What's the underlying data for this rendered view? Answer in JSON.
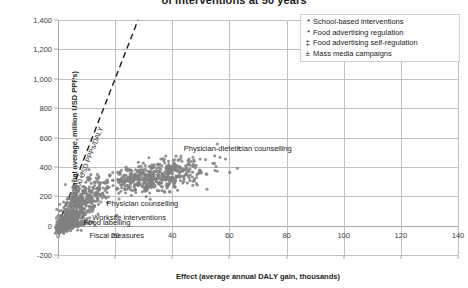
{
  "chart_data": {
    "type": "scatter",
    "title": "of interventions at 50 years",
    "xlabel": "Effect (average annual DALY gain, thousands)",
    "ylabel": "Cost (annual average, million USD PPPs)",
    "xlim": [
      0,
      140
    ],
    "ylim": [
      -200,
      1400
    ],
    "xticks": [
      "0",
      "20",
      "40",
      "60",
      "80",
      "100",
      "120",
      "140"
    ],
    "xtick_values": [
      0,
      20,
      40,
      60,
      80,
      100,
      120,
      140
    ],
    "yticks": [
      "-200",
      "0",
      "200",
      "400",
      "600",
      "800",
      "1,000",
      "1,200",
      "1,400"
    ],
    "ytick_values": [
      -200,
      0,
      200,
      400,
      600,
      800,
      1000,
      1200,
      1400
    ],
    "grid": true,
    "legend_position": "top-right",
    "marker_color": "#808080",
    "threshold": {
      "label": "50 000 USD PPPs/DALY",
      "slope_note": "line from origin, dashed",
      "x_at_ymax": 28,
      "style": "dashed"
    },
    "clusters": [
      {
        "name": "Physician-dietetician counselling",
        "label_x": 44,
        "label_y": 520,
        "center_x": 34,
        "center_y": 330,
        "spread_x": 9,
        "spread_y": 60,
        "n": 520
      },
      {
        "name": "Physician counselling",
        "label_x": 17,
        "label_y": 150,
        "center_x": 8,
        "center_y": 150,
        "spread_x": 4,
        "spread_y": 85,
        "n": 360
      },
      {
        "name": "Worksite interventions",
        "label_x": 12,
        "label_y": 55,
        "center_x": 3.5,
        "center_y": 40,
        "spread_x": 2.2,
        "spread_y": 28,
        "n": 200
      },
      {
        "name": "Food labelling",
        "label_x": 9,
        "label_y": 18,
        "center_x": 5.5,
        "center_y": 5,
        "spread_x": 3,
        "spread_y": 12,
        "n": 120
      },
      {
        "name": "Fiscal measures",
        "label_x": 11,
        "label_y": -70,
        "center_x": 2,
        "center_y": -18,
        "spread_x": 1.6,
        "spread_y": 16,
        "n": 90
      }
    ],
    "legend_entries": [
      {
        "marker": "*",
        "label": "School-based interventions"
      },
      {
        "marker": "*",
        "label": "Food advertising regulation"
      },
      {
        "marker": "‡",
        "label": "Food advertising self-regulation"
      },
      {
        "marker": "±",
        "label": "Mass media campaigns"
      }
    ]
  }
}
